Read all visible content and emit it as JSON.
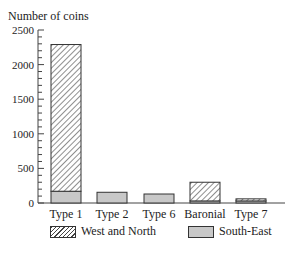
{
  "chart_data": {
    "type": "bar",
    "stacked": true,
    "title": "",
    "ylabel": "Number of coins",
    "xlabel": "",
    "ylim": [
      0,
      2500
    ],
    "yticks": [
      0,
      500,
      1000,
      1500,
      2000,
      2500
    ],
    "categories": [
      "Type 1",
      "Type 2",
      "Type 6",
      "Baronial",
      "Type 7"
    ],
    "series": [
      {
        "name": "South-East",
        "pattern": "solid-grey",
        "values": [
          170,
          155,
          130,
          30,
          30
        ]
      },
      {
        "name": "West and North",
        "pattern": "hatched",
        "values": [
          2120,
          0,
          0,
          270,
          30
        ]
      }
    ],
    "legend_position": "bottom",
    "grid": false
  },
  "legend": {
    "items": [
      {
        "label": "West and North",
        "icon": "hatched-swatch"
      },
      {
        "label": "South-East",
        "icon": "grey-swatch"
      }
    ]
  }
}
